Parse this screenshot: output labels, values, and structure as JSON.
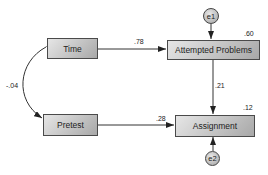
{
  "diagram": {
    "type": "path-diagram",
    "nodes": {
      "time": {
        "label": "Time"
      },
      "attempted": {
        "label": "Attempted Problems",
        "r2": ".60"
      },
      "pretest": {
        "label": "Pretest"
      },
      "assignment": {
        "label": "Assignment",
        "r2": ".12"
      }
    },
    "errors": {
      "e1": {
        "label": "e1",
        "target": "Attempted Problems"
      },
      "e2": {
        "label": "e2",
        "target": "Assignment"
      }
    },
    "paths": [
      {
        "from": "Time",
        "to": "Attempted Problems",
        "coef": ".78"
      },
      {
        "from": "Attempted Problems",
        "to": "Assignment",
        "coef": ".21"
      },
      {
        "from": "Pretest",
        "to": "Assignment",
        "coef": ".28"
      }
    ],
    "correlations": [
      {
        "between": [
          "Time",
          "Pretest"
        ],
        "coef": "-.04"
      }
    ]
  }
}
